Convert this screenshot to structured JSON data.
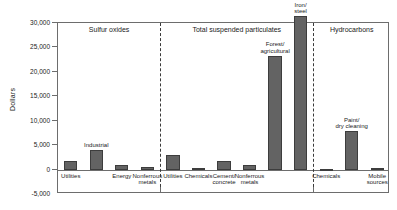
{
  "chart_data": {
    "type": "bar",
    "title": "",
    "xlabel": "",
    "ylabel": "Dollars",
    "ylim": [
      -5000,
      30000
    ],
    "ytick_labels": [
      "30,000",
      "25,000",
      "20,000",
      "15,000",
      "10,000",
      "5,000",
      "0",
      "-5,000"
    ],
    "ytick_values": [
      30000,
      25000,
      20000,
      15000,
      10000,
      5000,
      0,
      -5000
    ],
    "grid": false,
    "legend": "none",
    "panels": [
      {
        "name": "Sulfur oxides",
        "categories": [
          "Utilities",
          "Industrial",
          "Energy",
          "Nonferrous metals"
        ],
        "category_labels": [
          "Utilities",
          "Industrial",
          "Energy",
          "Nonferrous\nmetals"
        ],
        "values": [
          1800,
          4000,
          900,
          500
        ]
      },
      {
        "name": "Total suspended particulates",
        "categories": [
          "Utilities",
          "Chemicals",
          "Cement/concrete",
          "Nonferrous metals",
          "Forest/agricultural",
          "Iron/steel"
        ],
        "category_labels": [
          "Utilities",
          "Chemicals",
          "Cement/\nconcrete",
          "Nonferrous\nmetals",
          "Forest/\nagricultural",
          "Iron/\nsteel"
        ],
        "values": [
          3000,
          400,
          1700,
          1000,
          23300,
          31400
        ]
      },
      {
        "name": "Hydrocarbons",
        "categories": [
          "Chemicals",
          "Paint/dry cleaning",
          "Mobile sources"
        ],
        "category_labels": [
          "Chemicals",
          "Paint/\ndry cleaning",
          "Mobile\nsources"
        ],
        "values": [
          200,
          7800,
          300
        ]
      }
    ]
  },
  "style": {
    "bar_fill": "#636363",
    "bar_edge": "#3d3d3d",
    "axis_color": "#6d6d6d",
    "text_color": "#1a1a1a",
    "background": "#ffffff"
  }
}
